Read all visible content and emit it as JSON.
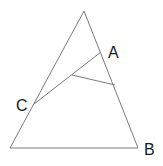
{
  "diagram": {
    "type": "geometry",
    "background": "#ffffff",
    "stroke_color": "#7a7a7a",
    "label_color": "#1a1a1a",
    "triangle": {
      "apex": [
        84,
        11
      ],
      "base_left": [
        10,
        148
      ],
      "base_right": [
        138,
        148
      ]
    },
    "segments": [
      {
        "name": "c-to-a-segment",
        "from": [
          34,
          104
        ],
        "to": [
          101,
          52
        ]
      },
      {
        "name": "interior-to-right-segment",
        "from": [
          72,
          75
        ],
        "to": [
          115,
          85
        ]
      }
    ],
    "labels": {
      "A": "A",
      "B": "B",
      "C": "C"
    }
  }
}
